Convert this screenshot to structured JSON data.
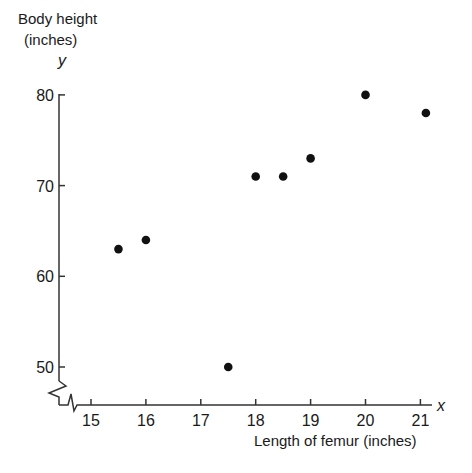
{
  "chart_data": {
    "type": "scatter",
    "title": "",
    "xlabel": "Length of femur (inches)",
    "ylabel": "Body height (inches)",
    "ylabel_lines": [
      "Body height",
      "(inches)"
    ],
    "x_var": "x",
    "y_var": "y",
    "x_ticks": [
      15,
      16,
      17,
      18,
      19,
      20,
      21
    ],
    "y_ticks": [
      50,
      60,
      70,
      80
    ],
    "xlim": [
      14.4,
      21.2
    ],
    "ylim": [
      46,
      80
    ],
    "axis_breaks": {
      "x": true,
      "y": true
    },
    "grid": false,
    "legend": null,
    "marker": {
      "shape": "circle",
      "color": "#111111"
    },
    "points": [
      {
        "x": 15.5,
        "y": 63
      },
      {
        "x": 16.0,
        "y": 64
      },
      {
        "x": 17.5,
        "y": 50
      },
      {
        "x": 18.0,
        "y": 71
      },
      {
        "x": 18.5,
        "y": 71
      },
      {
        "x": 19.0,
        "y": 73
      },
      {
        "x": 20.0,
        "y": 80
      },
      {
        "x": 21.1,
        "y": 78
      }
    ],
    "x": [
      15.5,
      16.0,
      17.5,
      18.0,
      18.5,
      19.0,
      20.0,
      21.1
    ],
    "y": [
      63,
      64,
      50,
      71,
      71,
      73,
      80,
      78
    ]
  },
  "labels": {
    "ylabel_line1": "Body height",
    "ylabel_line2": "(inches)",
    "y_var": "y",
    "x_var": "x",
    "xlabel": "Length of femur (inches)"
  }
}
